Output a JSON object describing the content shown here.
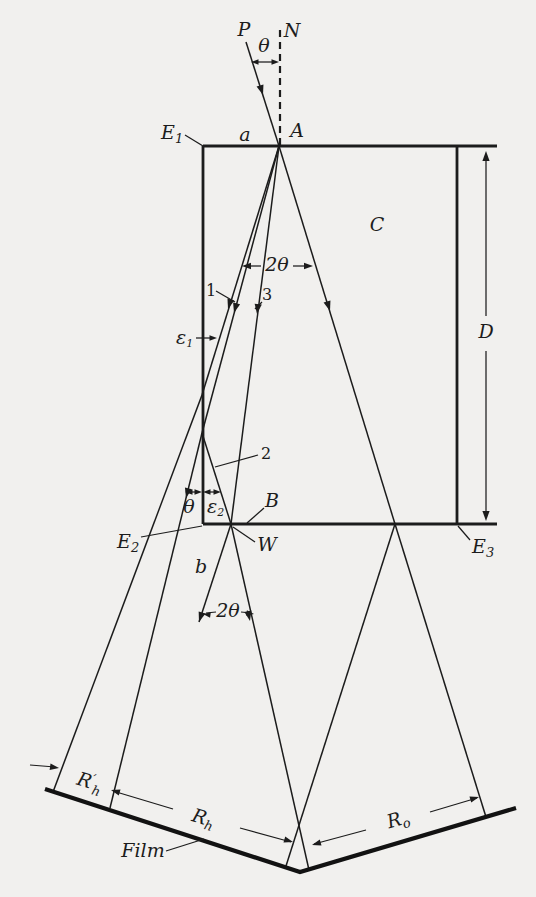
{
  "colors": {
    "ink": "#1c1c1c",
    "paper": "#f1f0ee"
  },
  "figure": {
    "beam_labels": {
      "incident": "P",
      "normal": "N",
      "ray1": "1",
      "ray2": "2",
      "ray3": "3"
    },
    "angle_labels": {
      "theta_top": "θ",
      "two_theta_upper": "2θ",
      "two_theta_lower": "2θ",
      "theta_exit": "θ",
      "epsilon1": {
        "base": "ε",
        "sub": "1"
      },
      "epsilon2": {
        "base": "ε",
        "sub": "2"
      }
    },
    "point_labels": {
      "entrance_point": "A",
      "entrance_region": "a",
      "exit_region": "b",
      "edge1": {
        "base": "E",
        "sub": "1"
      },
      "edge2": {
        "base": "E",
        "sub": "2"
      },
      "edge3": {
        "base": "E",
        "sub": "3"
      },
      "surface_point": "B",
      "exit_point": "W"
    },
    "crystal_label": "C",
    "thickness_label": "D",
    "film": {
      "label": "Film",
      "distance_side": {
        "base": "R",
        "prime": "′",
        "sub": "h"
      },
      "distance_diffracted": {
        "base": "R",
        "sub": "h"
      },
      "distance_direct": {
        "base": "R",
        "sub": "o"
      }
    }
  }
}
